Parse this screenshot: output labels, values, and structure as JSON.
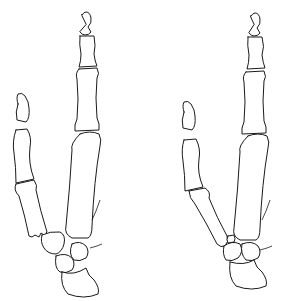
{
  "figure": {
    "colors": {
      "stroke": "#1a1a1a",
      "background": "#ffffff"
    },
    "panels": [
      {
        "label": ""
      },
      {
        "label": ""
      }
    ]
  }
}
